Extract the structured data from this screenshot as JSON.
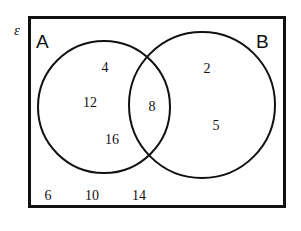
{
  "figure": {
    "type": "venn-diagram",
    "title": "",
    "universe_symbol": "ε",
    "stroke_color": "#111111",
    "background_color": "#ffffff",
    "border_width_px": 3,
    "circle_stroke_width_px": 2
  },
  "sets": {
    "left": {
      "name": "A",
      "label": "A",
      "center": {
        "x": 104,
        "y": 107
      },
      "radius": 66
    },
    "right": {
      "name": "B",
      "label": "B",
      "center": {
        "x": 202,
        "y": 105
      },
      "radius": 73
    }
  },
  "universe_rect": {
    "x": 28,
    "y": 16,
    "width": 258,
    "height": 192
  },
  "regions": {
    "a_only": {
      "region_name": "A only",
      "values": [
        {
          "text": "4",
          "x": 105,
          "y": 68
        },
        {
          "text": "12",
          "x": 90,
          "y": 103
        },
        {
          "text": "16",
          "x": 112,
          "y": 140
        }
      ]
    },
    "intersection": {
      "region_name": "A and B",
      "values": [
        {
          "text": "8",
          "x": 152,
          "y": 107
        }
      ]
    },
    "b_only": {
      "region_name": "B only",
      "values": [
        {
          "text": "2",
          "x": 207,
          "y": 69
        },
        {
          "text": "5",
          "x": 216,
          "y": 126
        }
      ]
    },
    "outside": {
      "region_name": "Outside A and B",
      "values": [
        {
          "text": "6",
          "x": 48,
          "y": 196
        },
        {
          "text": "10",
          "x": 92,
          "y": 196
        },
        {
          "text": "14",
          "x": 139,
          "y": 196
        }
      ]
    }
  },
  "chart_data": {
    "type": "diagram",
    "subtype": "venn",
    "title": "",
    "set_labels": [
      "A",
      "B"
    ],
    "universe_label": "ε",
    "members": {
      "A_only": [
        4,
        12,
        16
      ],
      "A_and_B": [
        8
      ],
      "B_only": [
        2,
        5
      ],
      "outside": [
        6,
        10,
        14
      ]
    },
    "counts": {
      "A_only": 3,
      "A_and_B": 1,
      "B_only": 2,
      "outside": 3
    }
  }
}
